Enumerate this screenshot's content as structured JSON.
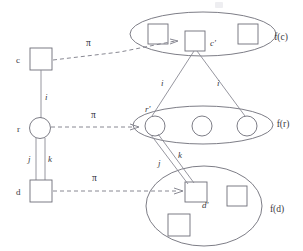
{
  "diagram": {
    "type": "graph-morphism",
    "colors": {
      "stroke": "#6e6e78",
      "edge": "#8a8a94",
      "dashed": "#7a7a86",
      "text": "#3a3a42",
      "background": "#ffffff"
    },
    "source_graph": {
      "nodes": [
        {
          "id": "c",
          "label": "c",
          "shape": "square",
          "x": 41,
          "y": 59
        },
        {
          "id": "r",
          "label": "r",
          "shape": "circle",
          "x": 40,
          "y": 128
        },
        {
          "id": "d",
          "label": "d",
          "shape": "square",
          "x": 41,
          "y": 191
        }
      ],
      "edges": [
        {
          "label": "i",
          "from": "c",
          "to": "r"
        },
        {
          "label": "j",
          "from": "r",
          "to": "d"
        },
        {
          "label": "k",
          "from": "r",
          "to": "d"
        }
      ]
    },
    "target_sets": [
      {
        "id": "f_c",
        "label": "f(c)",
        "shape": "ellipse",
        "member_shape": "square",
        "members": 3,
        "highlighted_member_label": "c'",
        "label_x": 274,
        "label_y": 38
      },
      {
        "id": "f_r",
        "label": "f(r)",
        "shape": "ellipse",
        "member_shape": "circle",
        "members": 3,
        "highlighted_member_label": "r'",
        "label_x": 272,
        "label_y": 124
      },
      {
        "id": "f_d",
        "label": "f(d)",
        "shape": "ellipse",
        "member_shape": "square",
        "members": 3,
        "highlighted_member_label": "d'",
        "label_x": 268,
        "label_y": 209
      }
    ],
    "mapping_edges": [
      {
        "label": "π",
        "from": "c",
        "to": "c'",
        "style": "dashed-arrow",
        "label_x": 89,
        "label_y": 44
      },
      {
        "label": "π",
        "from": "r",
        "to": "r'",
        "style": "dashed-arrow",
        "label_x": 94,
        "label_y": 116
      },
      {
        "label": "π",
        "from": "d",
        "to": "d'",
        "style": "dashed-arrow",
        "label_x": 95,
        "label_y": 179
      }
    ],
    "target_edges": [
      {
        "label": "i",
        "from": "c'",
        "to": "f(r) member 1",
        "label_x": 162,
        "label_y": 83
      },
      {
        "label": "i",
        "from": "c'",
        "to": "f(r) member 3",
        "label_x": 218,
        "label_y": 83
      },
      {
        "label": "j",
        "from": "r'",
        "to": "d'",
        "label_x": 160,
        "label_y": 163
      },
      {
        "label": "k",
        "from": "r'",
        "to": "d'",
        "label_x": 179,
        "label_y": 156
      }
    ],
    "source_edge_labels": {
      "i": {
        "text": "i",
        "x": 46,
        "y": 99
      },
      "j": {
        "text": "j",
        "x": 30,
        "y": 160
      },
      "k": {
        "text": "k",
        "x": 48,
        "y": 160
      }
    },
    "node_labels": {
      "c": {
        "text": "c",
        "x": 17,
        "y": 62
      },
      "r": {
        "text": "r",
        "x": 18,
        "y": 131
      },
      "d": {
        "text": "d",
        "x": 17,
        "y": 194
      },
      "c_prime": {
        "text": "c'",
        "x": 206,
        "y": 44
      },
      "r_prime": {
        "text": "r'",
        "x": 150,
        "y": 111
      },
      "d_prime": {
        "text": "d'",
        "x": 205,
        "y": 205
      }
    }
  }
}
